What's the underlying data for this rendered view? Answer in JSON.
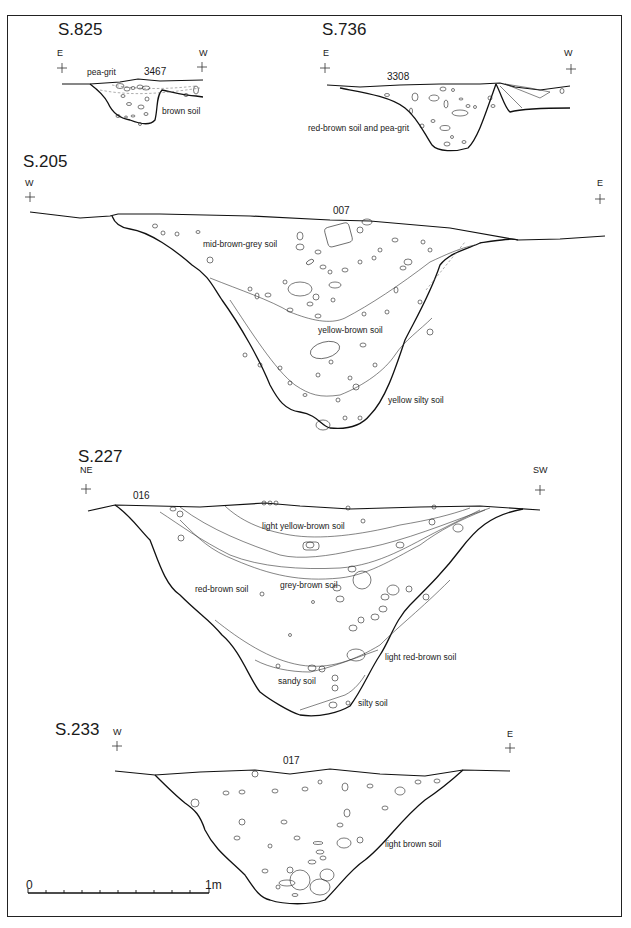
{
  "figure": {
    "type": "archaeological-section-drawings",
    "sections": [
      {
        "id": "S.825",
        "left_orientation": "E",
        "right_orientation": "W",
        "context": "3467",
        "fills": [
          "pea-grit",
          "brown soil"
        ]
      },
      {
        "id": "S.736",
        "left_orientation": "E",
        "right_orientation": "W",
        "context": "3308",
        "fills": [
          "red-brown soil and pea-grit"
        ]
      },
      {
        "id": "S.205",
        "left_orientation": "W",
        "right_orientation": "E",
        "context": "007",
        "fills": [
          "mid-brown-grey soil",
          "yellow-brown soil",
          "yellow silty soil"
        ]
      },
      {
        "id": "S.227",
        "left_orientation": "NE",
        "right_orientation": "SW",
        "context": "016",
        "fills": [
          "light yellow-brown soil",
          "grey-brown soil",
          "red-brown soil",
          "light red-brown soil",
          "sandy soil",
          "silty soil"
        ]
      },
      {
        "id": "S.233",
        "left_orientation": "W",
        "right_orientation": "E",
        "context": "017",
        "fills": [
          "light brown soil"
        ]
      }
    ],
    "scale_bar": {
      "start_label": "0",
      "end_label": "1m",
      "divisions": 10
    },
    "colors": {
      "ink": "#111111",
      "background": "#ffffff"
    }
  }
}
